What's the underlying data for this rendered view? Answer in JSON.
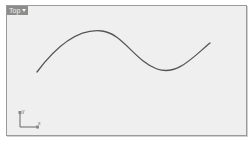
{
  "viewport": {
    "name": "Top",
    "dropdown_icon": "chevron-down-icon",
    "background": "#efefef",
    "border": "#9a9a9a",
    "curve_color": "#555555",
    "axes": {
      "y_label": "y",
      "x_label": "x"
    }
  }
}
